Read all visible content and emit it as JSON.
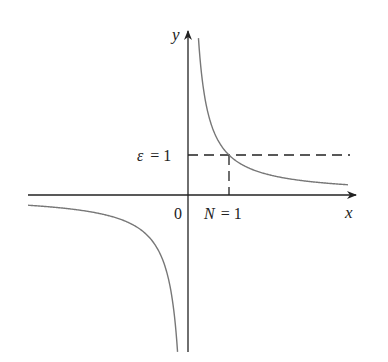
{
  "figure": {
    "function": "y = 1/x",
    "axes": {
      "x_label": "x",
      "y_label": "y",
      "origin_label": "0"
    },
    "annotations": {
      "epsilon_label": "ε = 1",
      "epsilon_symbol": "ε",
      "epsilon_value": "= 1",
      "n_label": "N = 1",
      "n_symbol": "N",
      "n_value": "= 1"
    },
    "colors": {
      "axis": "#222222",
      "curve": "#777777",
      "dashed": "#222222"
    }
  }
}
